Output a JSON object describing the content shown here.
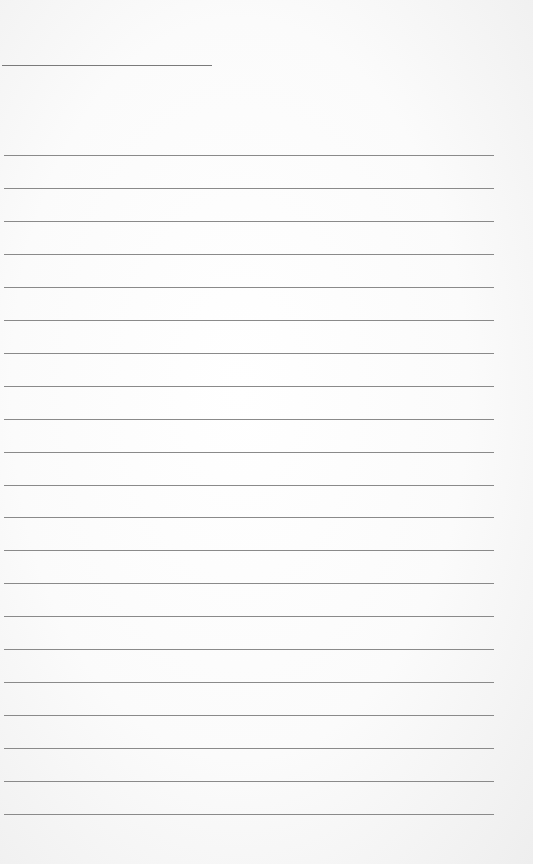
{
  "paper": {
    "type": "lined-notepaper",
    "header_line": {
      "top": 65,
      "left": 2,
      "width": 210
    },
    "rules": {
      "count": 21,
      "first_top": 155,
      "spacing": 32.95,
      "left": 4,
      "width": 490
    },
    "colors": {
      "background": "#ffffff",
      "line": "#8a8a8a"
    }
  }
}
